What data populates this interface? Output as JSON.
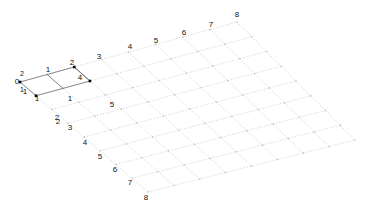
{
  "figure": {
    "title": "",
    "type": "mesh-grid-plot",
    "background_color": "#ffffff",
    "grid_line_color": "#c9c9c9",
    "grid_line_style": "dotted",
    "highlight_line_color": "#6e6e6e",
    "node_marker_color": "#000000",
    "label_color": "#111111"
  },
  "chart_data": {
    "type": "scatter",
    "title": "",
    "xlabel": "",
    "ylabel": "",
    "grid": true,
    "legend": null,
    "grid_rows": 8,
    "grid_cols": 8,
    "origin_label": "0",
    "top_edge_labels": [
      "1",
      "2",
      "3",
      "4",
      "5",
      "6",
      "7",
      "8"
    ],
    "left_edge_labels": [
      "1",
      "2",
      "3",
      "4",
      "5",
      "6",
      "7",
      "8"
    ],
    "highlight_labels": [
      "1",
      "2",
      "4",
      "1",
      "5",
      "1",
      "2"
    ],
    "corners": {
      "origin": [
        20,
        82
      ],
      "top": [
        237,
        22
      ],
      "bottom": [
        148,
        192
      ],
      "right": [
        355,
        140
      ]
    }
  },
  "labels": {
    "origin": {
      "text": "0",
      "x": 17,
      "y": 82
    },
    "origin_sub": {
      "text": "1",
      "x": 22,
      "y": 90
    },
    "origin_up": {
      "text": "2",
      "x": 22,
      "y": 74
    },
    "top_edge": [
      {
        "text": "1",
        "x": 48,
        "y": 70
      },
      {
        "text": "2",
        "x": 72,
        "y": 63
      },
      {
        "text": "3",
        "x": 99,
        "y": 57
      },
      {
        "text": "4",
        "x": 130,
        "y": 47
      },
      {
        "text": "5",
        "x": 156,
        "y": 41
      },
      {
        "text": "6",
        "x": 184,
        "y": 33
      },
      {
        "text": "7",
        "x": 211,
        "y": 25
      },
      {
        "text": "8",
        "x": 237,
        "y": 15
      }
    ],
    "left_edge": [
      {
        "text": "1",
        "x": 37,
        "y": 99
      },
      {
        "text": "2",
        "x": 57,
        "y": 118
      },
      {
        "text": "3",
        "x": 70,
        "y": 128
      },
      {
        "text": "4",
        "x": 85,
        "y": 143
      },
      {
        "text": "5",
        "x": 100,
        "y": 157
      },
      {
        "text": "6",
        "x": 115,
        "y": 170
      },
      {
        "text": "7",
        "x": 130,
        "y": 183
      },
      {
        "text": "8",
        "x": 146,
        "y": 198
      }
    ],
    "highlight": [
      {
        "text": "4",
        "x": 80,
        "y": 78
      },
      {
        "text": "1",
        "x": 70,
        "y": 99
      },
      {
        "text": "5",
        "x": 112,
        "y": 105
      },
      {
        "text": "1",
        "x": 25,
        "y": 92
      },
      {
        "text": "2",
        "x": 58,
        "y": 122
      }
    ]
  }
}
